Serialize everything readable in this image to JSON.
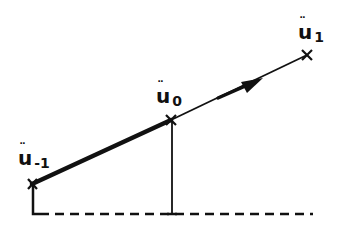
{
  "diagram": {
    "type": "linear-extrapolation-sketch",
    "stroke_color": "#111111",
    "background": "#ffffff",
    "points": [
      {
        "id": "u_minus_1",
        "label_base": "u",
        "label_diacritic": "¨",
        "label_sub": "-1",
        "marker": "x-cross"
      },
      {
        "id": "u_0",
        "label_base": "u",
        "label_diacritic": "¨",
        "label_sub": "0",
        "marker": "x-cross"
      },
      {
        "id": "u_1",
        "label_base": "u",
        "label_diacritic": "¨",
        "label_sub": "1",
        "marker": "x-cross"
      }
    ],
    "segments": [
      {
        "from": "u_minus_1",
        "to": "u_0",
        "style": "thick-solid"
      },
      {
        "from": "u_0",
        "to": "u_1",
        "style": "thin-solid",
        "arrow": "midway-toward-u_1"
      },
      {
        "from": "u_minus_1",
        "to": "baseline",
        "style": "thin-vertical"
      },
      {
        "from": "u_0",
        "to": "baseline",
        "style": "thin-vertical"
      }
    ],
    "baseline": {
      "style": "dashed"
    }
  }
}
